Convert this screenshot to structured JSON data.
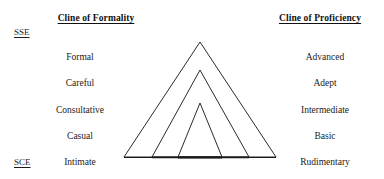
{
  "canvas": {
    "width": 384,
    "height": 179,
    "background": "#ffffff",
    "ink": "#1a1a1a",
    "stroke": "#2b2b2b"
  },
  "headings": {
    "left": "Cline of Formality",
    "right": "Cline of Proficiency"
  },
  "endpoints": {
    "top": "SSE",
    "bottom": "SCE"
  },
  "formality": {
    "items": [
      {
        "label": "Formal"
      },
      {
        "label": "Careful"
      },
      {
        "label": "Consultative"
      },
      {
        "label": "Casual"
      },
      {
        "label": "Intimate"
      }
    ]
  },
  "proficiency": {
    "items": [
      {
        "label": "Advanced"
      },
      {
        "label": "Adept"
      },
      {
        "label": "Intermediate"
      },
      {
        "label": "Basic"
      },
      {
        "label": "Rudimentary"
      }
    ]
  },
  "diagram": {
    "type": "nested-triangles",
    "count": 3,
    "apex_x": 200,
    "baseline_y": 157,
    "triangles": [
      {
        "name": "outer-triangle",
        "apex_y": 42,
        "left_x": 124,
        "right_x": 276
      },
      {
        "name": "middle-triangle",
        "apex_y": 70,
        "left_x": 152,
        "right_x": 249
      },
      {
        "name": "inner-triangle",
        "apex_y": 103,
        "left_x": 178,
        "right_x": 222
      }
    ],
    "baseline": {
      "x1": 124,
      "x2": 276,
      "y": 157
    }
  }
}
